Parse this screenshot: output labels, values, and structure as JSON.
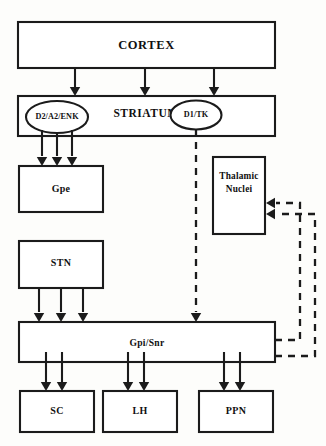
{
  "diagram": {
    "stroke_color": "#1b1b1b",
    "background_color": "#fdfdfb",
    "nodes": {
      "cortex": {
        "label": "CORTEX"
      },
      "striatum": {
        "label": "STRIATUM"
      },
      "d2_ellipse": {
        "label": "D2/A2/ENK"
      },
      "d1_ellipse": {
        "label": "D1/TK"
      },
      "gpe": {
        "label": "Gpe"
      },
      "stn": {
        "label": "STN"
      },
      "thalamic": {
        "label_line1": "Thalamic",
        "label_line2": "Nuclei"
      },
      "gpi_snr": {
        "label": "Gpi/Snr"
      },
      "sc": {
        "label": "SC"
      },
      "lh": {
        "label": "LH"
      },
      "ppn": {
        "label": "PPN"
      }
    },
    "connections": [
      {
        "name": "cortex-to-striatum",
        "from": "cortex",
        "to": "striatum",
        "style": "solid",
        "count": 3
      },
      {
        "name": "d2-to-gpe",
        "from": "d2_ellipse",
        "to": "gpe",
        "style": "solid",
        "count": 3
      },
      {
        "name": "d1-to-gpi",
        "from": "d1_ellipse",
        "to": "gpi_snr",
        "style": "dashed",
        "count": 1
      },
      {
        "name": "stn-to-gpi",
        "from": "stn",
        "to": "gpi_snr",
        "style": "solid",
        "count": 3
      },
      {
        "name": "gpi-to-sc",
        "from": "gpi_snr",
        "to": "sc",
        "style": "solid",
        "count": 2
      },
      {
        "name": "gpi-to-lh",
        "from": "gpi_snr",
        "to": "lh",
        "style": "solid",
        "count": 2
      },
      {
        "name": "gpi-to-ppn",
        "from": "gpi_snr",
        "to": "ppn",
        "style": "solid",
        "count": 2
      },
      {
        "name": "gpi-to-thalamic-inner",
        "from": "gpi_snr",
        "to": "thalamic",
        "style": "dashed",
        "count": 1
      },
      {
        "name": "gpi-to-thalamic-outer",
        "from": "gpi_snr",
        "to": "thalamic",
        "style": "dashed",
        "count": 1
      }
    ]
  }
}
